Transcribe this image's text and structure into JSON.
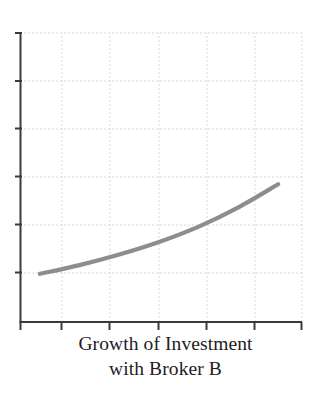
{
  "chart_data": {
    "type": "line",
    "title": "Growth of Investment with Broker B",
    "title_lines": [
      "Growth of Investment",
      "with Broker B"
    ],
    "xlabel": "",
    "ylabel": "",
    "x": [
      1,
      2,
      3,
      4,
      5,
      6,
      7
    ],
    "values": [
      1.0,
      1.18,
      1.4,
      1.66,
      1.98,
      2.38,
      2.86
    ],
    "series": [
      {
        "name": "Growth of Investment with Broker B",
        "values": [
          1.0,
          1.18,
          1.4,
          1.66,
          1.98,
          2.38,
          2.86
        ],
        "color": "#8d8d8d",
        "line_width": 4.2,
        "style": "smooth-increasing-convex"
      }
    ],
    "xlim": [
      0.5,
      7.6
    ],
    "ylim": [
      0.0,
      6.0
    ],
    "xticks": [
      0.5,
      1.5,
      2.5,
      3.5,
      4.5,
      5.5,
      6.5
    ],
    "yticks": [
      0,
      1,
      2,
      3,
      4,
      5
    ],
    "xticklabels": [],
    "yticklabels": [],
    "grid": true,
    "grid_style": "dotted",
    "grid_color": "#d8d8d8",
    "axis_color": "#3a3a3a",
    "background": "#ffffff",
    "legend": false,
    "legend_position": "none",
    "annotations": []
  },
  "axes": {
    "y_axis_name": "y-axis",
    "x_axis_name": "x-axis",
    "tick_count_y": 6,
    "tick_count_x": 7
  },
  "colors": {
    "line": "#8d8d8d",
    "axis": "#3a3a3a",
    "grid": "#d8d8d8",
    "title_text": "#23201f",
    "background": "#ffffff"
  }
}
